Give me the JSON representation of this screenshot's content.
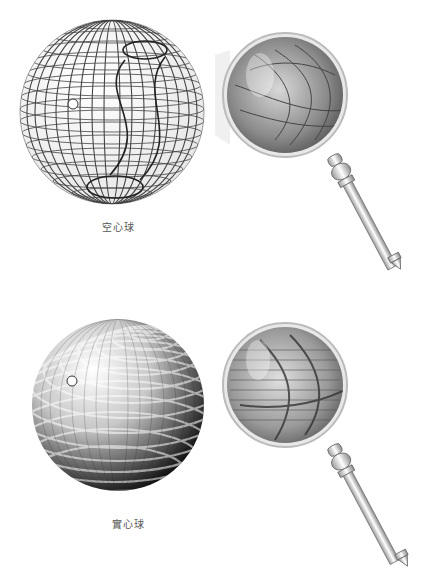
{
  "figures": [
    {
      "id": "hollow",
      "label": "空心球",
      "sphere_style": "wireframe",
      "has_marker_dot": true,
      "magnifier": true
    },
    {
      "id": "solid",
      "label": "實心球",
      "sphere_style": "shaded",
      "has_marker_dot": true,
      "magnifier": true
    }
  ],
  "colors": {
    "background": "#ffffff",
    "line": "#3a3a3a",
    "shade_dark": "#1a1a1a",
    "shade_light": "#f2f2f2",
    "label": "#555555"
  }
}
